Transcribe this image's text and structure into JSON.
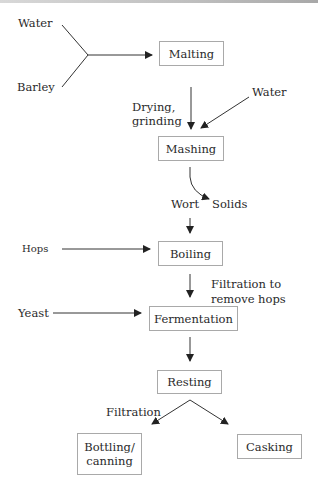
{
  "diagram": {
    "steps": {
      "malting": "Malting",
      "mashing": "Mashing",
      "boiling": "Boiling",
      "fermentation": "Fermentation",
      "resting": "Resting",
      "bottling_line1": "Bottling/",
      "bottling_line2": "canning",
      "casking": "Casking"
    },
    "inputs": {
      "water_1": "Water",
      "barley": "Barley",
      "water_2": "Water",
      "hops": "Hops",
      "yeast": "Yeast"
    },
    "edge_labels": {
      "drying_line1": "Drying,",
      "drying_line2": "grinding",
      "wort": "Wort",
      "solids": "Solids",
      "filtration_hops_line1": "Filtration to",
      "filtration_hops_line2": "remove hops",
      "filtration": "Filtration"
    },
    "colors": {
      "line": "#333333",
      "box_border": "#a9a9a9",
      "text": "#2a2a2a"
    }
  }
}
